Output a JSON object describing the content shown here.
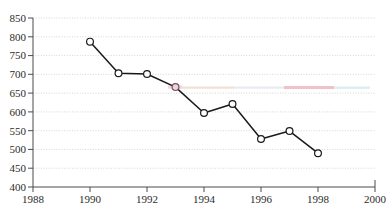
{
  "chart_data": {
    "type": "line",
    "title": "",
    "subtitle": "",
    "xlabel": "",
    "ylabel": "",
    "x": [
      1990,
      1991,
      1992,
      1993,
      1994,
      1995,
      1996,
      1997,
      1998
    ],
    "values": [
      787,
      703,
      701,
      666,
      597,
      621,
      528,
      549,
      490
    ],
    "series": [
      {
        "name": "",
        "x": [
          1990,
          1991,
          1992,
          1993,
          1994,
          1995,
          1996,
          1997,
          1998
        ],
        "values": [
          787,
          703,
          701,
          666,
          597,
          621,
          528,
          549,
          490
        ]
      }
    ],
    "xlim": [
      1988,
      2000
    ],
    "ylim": [
      400,
      850
    ],
    "xticks": [
      1988,
      1990,
      1992,
      1994,
      1996,
      1998,
      2000
    ],
    "xtick_labels": [
      "1988",
      "1990",
      "1992",
      "1994",
      "1996",
      "1998",
      "2000"
    ],
    "yticks": [
      400,
      450,
      500,
      550,
      600,
      650,
      700,
      750,
      800,
      850
    ],
    "ytick_labels": [
      "400",
      "450",
      "500",
      "550",
      "600",
      "650",
      "700",
      "750",
      "800",
      "850"
    ],
    "grid": "horizontal-dotted",
    "legend": "none",
    "marker": "open-circle",
    "line_color": "#1a1a1a",
    "grid_color": "#c9c9cf",
    "axis_color": "#4a4a4a",
    "background": "#ffffff",
    "annotations": []
  },
  "figure": {
    "plot_left": 33,
    "plot_right": 375,
    "plot_top": 18,
    "plot_bottom": 187
  }
}
